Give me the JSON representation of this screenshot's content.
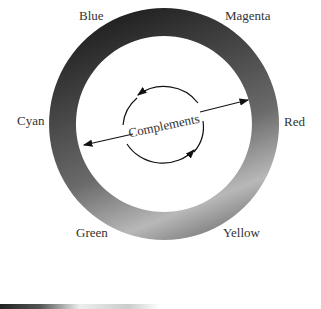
{
  "diagram": {
    "type": "color-wheel",
    "labels": {
      "blue": "Blue",
      "magenta": "Magenta",
      "red": "Red",
      "yellow": "Yellow",
      "green": "Green",
      "cyan": "Cyan"
    },
    "center_label": "Complements"
  }
}
